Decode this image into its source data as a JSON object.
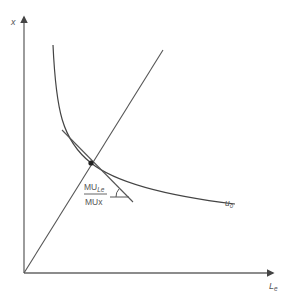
{
  "diagram": {
    "type": "indifference-curve-tangency",
    "axes": {
      "y_label": "x",
      "x_label_main": "L",
      "x_label_sub": "e"
    },
    "curve": {
      "label_main": "u",
      "label_sub": "0"
    },
    "slope_annotation": {
      "numerator_main": "MU",
      "numerator_sub": "Le",
      "denominator": "MUx"
    },
    "elements": [
      "vertical axis (x)",
      "horizontal axis (Le)",
      "ray from origin",
      "indifference curve u0",
      "tangent line at optimum",
      "tangency point",
      "slope angle arc"
    ],
    "colors": {
      "line": "#555555",
      "axis": "#666666",
      "background": "#ffffff"
    }
  }
}
